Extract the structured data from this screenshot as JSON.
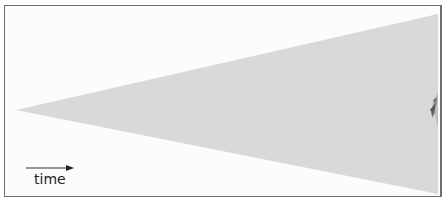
{
  "diagram": {
    "label": "time",
    "arrow_direction": "right",
    "wedge": {
      "tip": [
        16,
        110
      ],
      "top_right": [
        438,
        14
      ],
      "bottom_right": [
        438,
        194
      ],
      "fill": "#d9d9d9"
    },
    "frame_color": "#6e6e6e"
  }
}
